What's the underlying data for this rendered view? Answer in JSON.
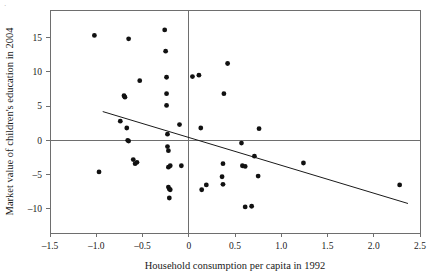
{
  "chart_data": {
    "type": "scatter",
    "title": "",
    "xlabel": "Household consumption per capita in 1992",
    "ylabel": "Market value of children's education in 2004",
    "xlim": [
      -1.5,
      2.5
    ],
    "ylim": [
      -13.5,
      19.0
    ],
    "xticks": [
      -1.5,
      -1.0,
      -0.5,
      0,
      0.5,
      1.0,
      1.5,
      2.0,
      2.5
    ],
    "xticklabels": [
      "–1.5",
      "–1.0",
      "–0.5",
      "0",
      "0.5",
      "1.0",
      "1.5",
      "2.0",
      "2.5"
    ],
    "yticks": [
      15,
      10,
      5,
      0,
      -5,
      -10
    ],
    "yticklabels": [
      "15",
      "10",
      "5",
      "0",
      "–5",
      "–10"
    ],
    "grid": false,
    "legend": null,
    "reference_lines": [
      {
        "name": "horizontal-zero-line",
        "orientation": "horizontal",
        "value": 0
      },
      {
        "name": "vertical-zero-line",
        "orientation": "vertical",
        "value": 0
      }
    ],
    "fit_line": {
      "name": "regression-line",
      "x_start": -0.93,
      "y_start": 4.2,
      "x_end": 2.37,
      "y_end": -9.2,
      "slope": -4.06,
      "intercept": 0.42
    },
    "marker_color": "#111111",
    "axis_color": "#6e6e6e",
    "points": [
      {
        "x": -1.02,
        "y": 15.3
      },
      {
        "x": -0.97,
        "y": -4.6
      },
      {
        "x": -0.74,
        "y": 2.8
      },
      {
        "x": -0.7,
        "y": 6.5
      },
      {
        "x": -0.69,
        "y": 6.3
      },
      {
        "x": -0.67,
        "y": 1.8
      },
      {
        "x": -0.65,
        "y": 14.8
      },
      {
        "x": -0.66,
        "y": 0.0
      },
      {
        "x": -0.65,
        "y": -0.1
      },
      {
        "x": -0.6,
        "y": -2.8
      },
      {
        "x": -0.58,
        "y": -3.4
      },
      {
        "x": -0.56,
        "y": -3.2
      },
      {
        "x": -0.53,
        "y": 8.7
      },
      {
        "x": -0.26,
        "y": 16.1
      },
      {
        "x": -0.25,
        "y": 13.0
      },
      {
        "x": -0.24,
        "y": 9.2
      },
      {
        "x": -0.24,
        "y": 6.8
      },
      {
        "x": -0.24,
        "y": 5.1
      },
      {
        "x": -0.23,
        "y": 0.9
      },
      {
        "x": -0.23,
        "y": -0.9
      },
      {
        "x": -0.22,
        "y": -1.5
      },
      {
        "x": -0.22,
        "y": -3.9
      },
      {
        "x": -0.2,
        "y": -3.7
      },
      {
        "x": -0.22,
        "y": -6.8
      },
      {
        "x": -0.21,
        "y": -7.1
      },
      {
        "x": -0.2,
        "y": -7.2
      },
      {
        "x": -0.21,
        "y": -8.4
      },
      {
        "x": -0.1,
        "y": 2.3
      },
      {
        "x": -0.08,
        "y": -3.7
      },
      {
        "x": 0.04,
        "y": 9.3
      },
      {
        "x": 0.11,
        "y": 9.5
      },
      {
        "x": 0.13,
        "y": 1.8
      },
      {
        "x": 0.14,
        "y": -7.2
      },
      {
        "x": 0.19,
        "y": -6.5
      },
      {
        "x": 0.37,
        "y": -3.4
      },
      {
        "x": 0.36,
        "y": -5.3
      },
      {
        "x": 0.37,
        "y": -6.4
      },
      {
        "x": 0.38,
        "y": 6.8
      },
      {
        "x": 0.42,
        "y": 11.2
      },
      {
        "x": 0.57,
        "y": -0.4
      },
      {
        "x": 0.58,
        "y": -3.7
      },
      {
        "x": 0.61,
        "y": -3.8
      },
      {
        "x": 0.61,
        "y": -9.7
      },
      {
        "x": 0.68,
        "y": -9.6
      },
      {
        "x": 0.71,
        "y": -2.3
      },
      {
        "x": 0.75,
        "y": -5.2
      },
      {
        "x": 0.76,
        "y": 1.7
      },
      {
        "x": 1.24,
        "y": -3.3
      },
      {
        "x": 2.28,
        "y": -6.5
      }
    ]
  },
  "page": {
    "corner_mark": "·"
  }
}
